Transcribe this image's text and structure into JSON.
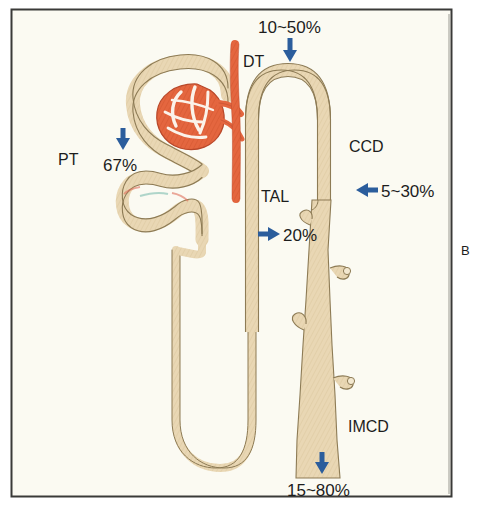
{
  "figure": {
    "panel_letter": "B",
    "background_color": "#fbfaf2",
    "frame_color": "#3a3a38",
    "tubule_fill": "#e9d7b4",
    "tubule_stroke": "#8d7b55",
    "glomerulus_fill": "#e4663f",
    "glomerulus_stroke": "#b8482a",
    "arrow_color": "#2b5d9c",
    "label_color": "#1d1d1d"
  },
  "structures": [
    {
      "id": "pt",
      "name": "proximal-tubule"
    },
    {
      "id": "bowman",
      "name": "bowmans-capsule"
    },
    {
      "id": "glomerulus",
      "name": "glomerulus"
    },
    {
      "id": "dt",
      "name": "distal-tubule"
    },
    {
      "id": "tal",
      "name": "thick-ascending-limb"
    },
    {
      "id": "loop",
      "name": "loop-of-henle"
    },
    {
      "id": "ccd",
      "name": "cortical-collecting-duct"
    },
    {
      "id": "imcd",
      "name": "inner-medullary-collecting-duct"
    }
  ],
  "labels": {
    "pt": "PT",
    "dt": "DT",
    "tal": "TAL",
    "ccd": "CCD",
    "imcd": "IMCD"
  },
  "values": {
    "pt_reabsorption": "67%",
    "dt_ccd_top": "10~50%",
    "tal_reabsorption": "20%",
    "ccd_reabsorption": "5~30%",
    "imcd_reabsorption": "15~80%"
  },
  "arrows": [
    {
      "id": "arrow-top",
      "label": "10~50%",
      "direction": "down"
    },
    {
      "id": "arrow-pt",
      "label": "67%",
      "direction": "down"
    },
    {
      "id": "arrow-tal",
      "label": "20%",
      "direction": "right"
    },
    {
      "id": "arrow-ccd",
      "label": "5~30%",
      "direction": "left"
    },
    {
      "id": "arrow-imcd",
      "label": "15~80%",
      "direction": "down"
    }
  ]
}
